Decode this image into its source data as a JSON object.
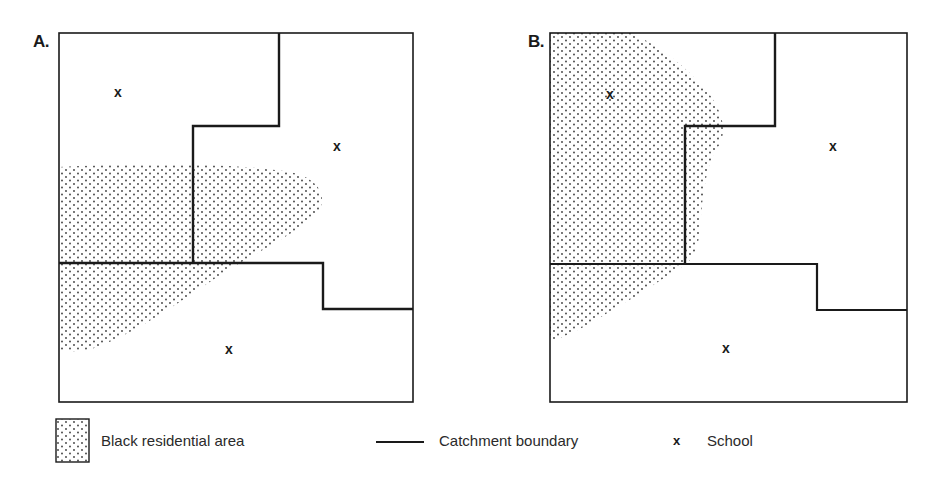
{
  "figure": {
    "panels": [
      {
        "label": "A.",
        "schools": [
          {
            "symbol": "x",
            "x": 118,
            "y": 92
          },
          {
            "symbol": "x",
            "x": 337,
            "y": 146
          },
          {
            "symbol": "x",
            "x": 229,
            "y": 349
          }
        ]
      },
      {
        "label": "B.",
        "schools": [
          {
            "symbol": "x",
            "x": 610,
            "y": 94
          },
          {
            "symbol": "x",
            "x": 833,
            "y": 146
          },
          {
            "symbol": "x",
            "x": 726,
            "y": 348
          }
        ]
      }
    ],
    "legend": {
      "residential_label": "Black residential area",
      "boundary_label": "Catchment boundary",
      "school_symbol": "x",
      "school_label": "School"
    },
    "colors": {
      "line": "#1a1a1a",
      "dots": "#3a3a3a",
      "background": "#ffffff"
    }
  }
}
